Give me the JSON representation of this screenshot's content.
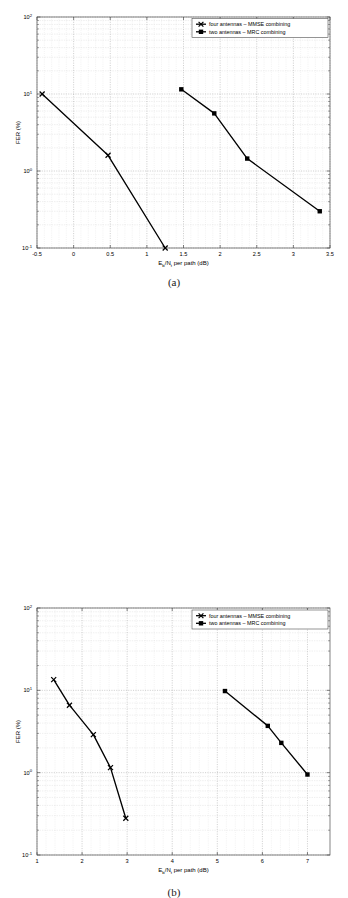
{
  "figure": {
    "panels": [
      {
        "caption": "(a)",
        "xlabel_main": "E",
        "xlabel_sub1": "b",
        "xlabel_mid": "/N",
        "xlabel_sub2": "t",
        "xlabel_tail": " per path (dB)",
        "xlabel_full": "Eb/Nt per path (dB)",
        "ylabel": "FER (%)",
        "xticks": [
          "-0.5",
          "0",
          "0.5",
          "1",
          "1.5",
          "2",
          "2.5",
          "3",
          "3.5"
        ],
        "xtick_values": [
          -0.5,
          0,
          0.5,
          1,
          1.5,
          2,
          2.5,
          3,
          3.5
        ],
        "yticks": [
          "10",
          "10",
          "10",
          "10"
        ],
        "ytick_exponents": [
          "-1",
          "0",
          "1",
          "2"
        ],
        "ytick_values": [
          0.1,
          1,
          10,
          100
        ],
        "legend": [
          {
            "label": "four antennas – MMSE combining",
            "marker": "x-marker"
          },
          {
            "label": "two antennas – MRC combining",
            "marker": "square-marker"
          }
        ]
      },
      {
        "caption": "(b)",
        "xlabel_main": "E",
        "xlabel_sub1": "b",
        "xlabel_mid": "/N",
        "xlabel_sub2": "t",
        "xlabel_tail": " per path (dB)",
        "xlabel_full": "Eb/Nt per path (dB)",
        "ylabel": "FER (%)",
        "xticks": [
          "1",
          "2",
          "3",
          "4",
          "5",
          "6",
          "7"
        ],
        "xtick_values": [
          1,
          2,
          3,
          4,
          5,
          6,
          7
        ],
        "yticks": [
          "10",
          "10",
          "10",
          "10"
        ],
        "ytick_exponents": [
          "-1",
          "0",
          "1",
          "2"
        ],
        "ytick_values": [
          0.1,
          1,
          10,
          100
        ],
        "legend": [
          {
            "label": "four antennas – MMSE combining",
            "marker": "x-marker"
          },
          {
            "label": "two antennas – MRC combining",
            "marker": "square-marker"
          }
        ]
      }
    ]
  },
  "chart_data": [
    {
      "type": "line",
      "title": "(a)",
      "xlabel": "Eb/Nt per path (dB)",
      "ylabel": "FER (%)",
      "yscale": "log",
      "xlim": [
        -0.5,
        3.5
      ],
      "ylim": [
        0.1,
        100
      ],
      "grid": true,
      "legend_position": "top-right",
      "series": [
        {
          "name": "four antennas – MMSE combining",
          "marker": "x",
          "x": [
            -0.43,
            0.47,
            1.25
          ],
          "y": [
            10.0,
            1.6,
            0.1
          ]
        },
        {
          "name": "two antennas – MRC combining",
          "marker": "s",
          "x": [
            1.47,
            1.92,
            2.37,
            3.36
          ],
          "y": [
            11.5,
            5.6,
            1.45,
            0.3
          ]
        }
      ]
    },
    {
      "type": "line",
      "title": "(b)",
      "xlabel": "Eb/Nt per path (dB)",
      "ylabel": "FER (%)",
      "yscale": "log",
      "xlim": [
        1,
        7.5
      ],
      "ylim": [
        0.1,
        100
      ],
      "grid": true,
      "legend_position": "top-right",
      "series": [
        {
          "name": "four antennas – MMSE combining",
          "marker": "x",
          "x": [
            1.37,
            1.72,
            2.25,
            2.63,
            2.97
          ],
          "y": [
            13.5,
            6.6,
            2.9,
            1.15,
            0.28
          ]
        },
        {
          "name": "two antennas – MRC combining",
          "marker": "s",
          "x": [
            5.17,
            6.12,
            6.42,
            7.0
          ],
          "y": [
            9.8,
            3.7,
            2.3,
            0.95
          ]
        }
      ]
    }
  ]
}
